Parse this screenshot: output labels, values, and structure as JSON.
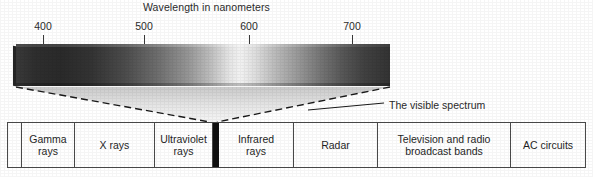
{
  "figure": {
    "title": "Wavelength in nanometers",
    "callout": "The visible spectrum",
    "width": 593,
    "height": 177
  },
  "axis": {
    "unit": "nanometers",
    "ticks": [
      {
        "label": "400",
        "x": 43
      },
      {
        "label": "500",
        "x": 144
      },
      {
        "label": "600",
        "x": 249
      },
      {
        "label": "700",
        "x": 352
      }
    ]
  },
  "spectrum_bar": {
    "description": "visible-spectrum-gradient",
    "left": 16,
    "top": 44,
    "width": 374,
    "height": 42,
    "start_color": "#3a3a3a",
    "peak_color": "#f2f2f2",
    "end_color": "#333333"
  },
  "wedge": {
    "stroke_color": "#1a1a1a",
    "fill_top_color": "#cfcfcf",
    "fill_bottom_color": "#f4f4f4",
    "apex_x": 213,
    "apex_y": 122
  },
  "callout_line": {
    "color": "#1a1a1a",
    "from_x": 308,
    "from_y": 110,
    "to_x": 384,
    "to_y": 103
  },
  "bands": [
    {
      "label": "",
      "width": 14,
      "kind": "edge"
    },
    {
      "label": "Gamma\nrays",
      "width": 53,
      "kind": "band"
    },
    {
      "label": "X rays",
      "width": 80,
      "kind": "band"
    },
    {
      "label": "Ultraviolet\nrays",
      "width": 58,
      "kind": "band"
    },
    {
      "label": "",
      "width": 6,
      "kind": "visible"
    },
    {
      "label": "Infrared\nrays",
      "width": 75,
      "kind": "band"
    },
    {
      "label": "Radar",
      "width": 84,
      "kind": "band"
    },
    {
      "label": "Television and radio\nbroadcast bands",
      "width": 133,
      "kind": "band"
    },
    {
      "label": "AC circuits",
      "width": 74,
      "kind": "band"
    }
  ],
  "colors": {
    "ink": "#1f1f1f",
    "rule": "#4a4a4a",
    "paper": "#ffffff",
    "visible_slot": "#111111"
  }
}
